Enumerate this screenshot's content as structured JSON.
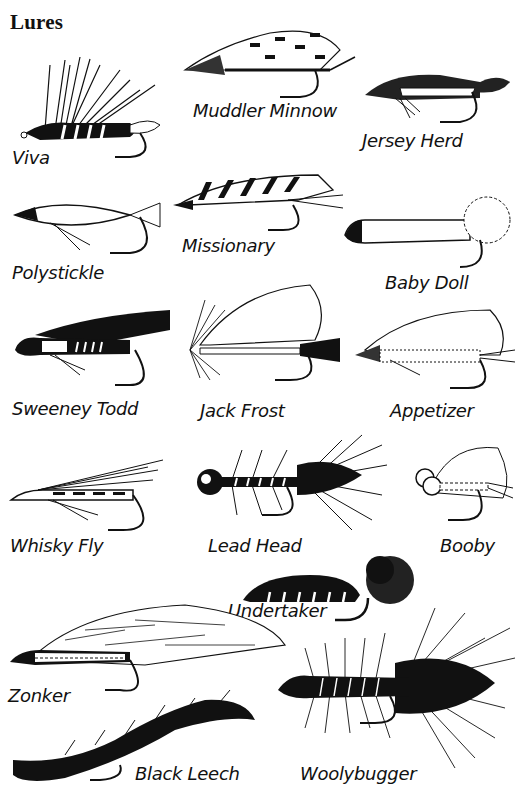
{
  "title": "Lures",
  "flies": [
    {
      "id": "viva",
      "label": "Viva"
    },
    {
      "id": "muddler-minnow",
      "label": "Muddler Minnow"
    },
    {
      "id": "jersey-herd",
      "label": "Jersey Herd"
    },
    {
      "id": "polystickle",
      "label": "Polystickle"
    },
    {
      "id": "missionary",
      "label": "Missionary"
    },
    {
      "id": "baby-doll",
      "label": "Baby Doll"
    },
    {
      "id": "sweeney-todd",
      "label": "Sweeney Todd"
    },
    {
      "id": "jack-frost",
      "label": "Jack Frost"
    },
    {
      "id": "appetizer",
      "label": "Appetizer"
    },
    {
      "id": "whisky-fly",
      "label": "Whisky Fly"
    },
    {
      "id": "lead-head",
      "label": "Lead Head"
    },
    {
      "id": "booby",
      "label": "Booby"
    },
    {
      "id": "undertaker",
      "label": "Undertaker"
    },
    {
      "id": "zonker",
      "label": "Zonker"
    },
    {
      "id": "black-leech",
      "label": "Black Leech"
    },
    {
      "id": "woolybugger",
      "label": "Woolybugger"
    }
  ]
}
